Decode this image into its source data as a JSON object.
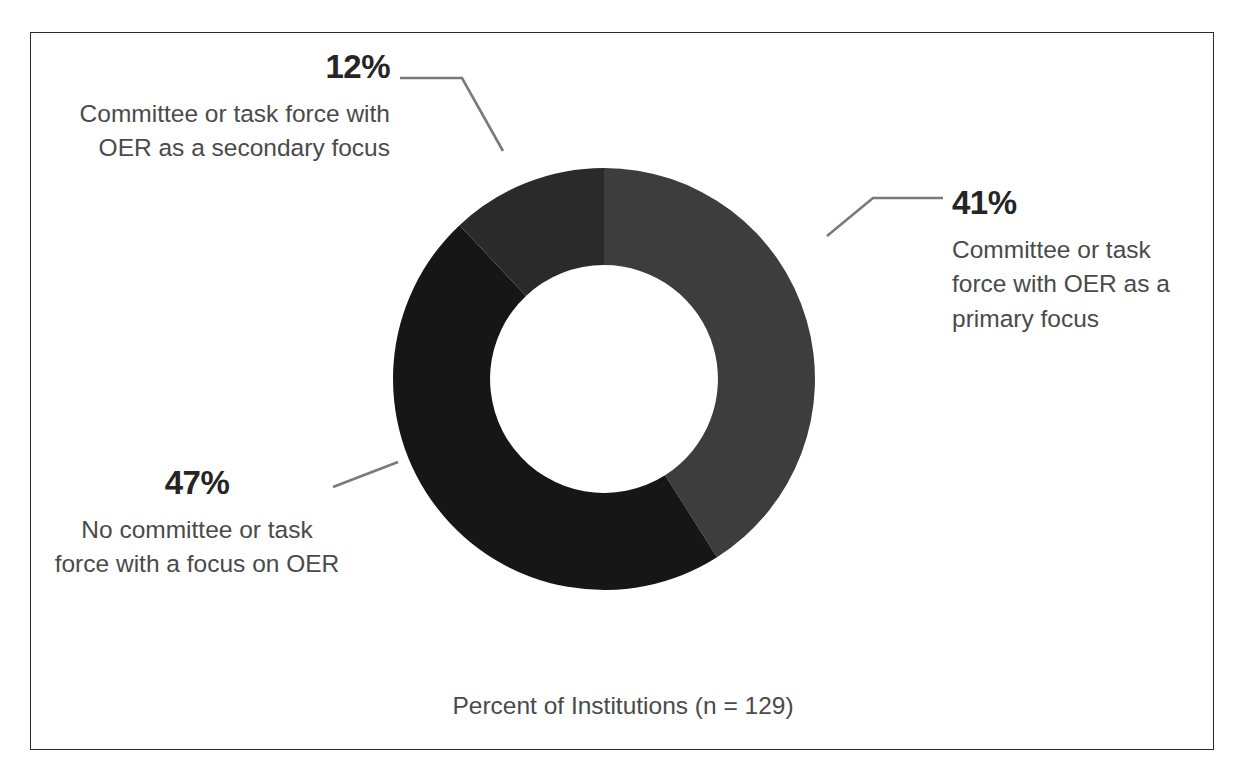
{
  "figure": {
    "caption": "Percent of Institutions (n = 129)",
    "frame_color": "#2b2b2b",
    "background": "#ffffff"
  },
  "chart_data": {
    "type": "pie",
    "variant": "donut",
    "title": "",
    "xlabel": "",
    "ylabel": "",
    "caption": "Percent of Institutions (n = 129)",
    "sample_size": 129,
    "units": "percent",
    "legend_position": "callout-labels",
    "grid": false,
    "start_angle_deg": 0,
    "direction": "clockwise",
    "inner_radius_ratio": 0.54,
    "categories": [
      "Committee or task force with OER as a primary focus",
      "No committee or task force with a focus on OER",
      "Committee or task force with OER as a secondary focus"
    ],
    "values": [
      41,
      47,
      12
    ],
    "labels": [
      "41%",
      "47%",
      "12%"
    ],
    "colors": [
      "#3d3d3d",
      "#161616",
      "#2a2a2a"
    ],
    "slices": [
      {
        "label": "41%",
        "value": 41,
        "name": "Committee or task force with OER as a primary focus",
        "color": "#3d3d3d",
        "start_deg": 0,
        "end_deg": 147.6
      },
      {
        "label": "47%",
        "value": 47,
        "name": "No committee or task force with a focus on OER",
        "color": "#161616",
        "start_deg": 147.6,
        "end_deg": 316.8
      },
      {
        "label": "12%",
        "value": 12,
        "name": "Committee or task force with OER as a secondary focus",
        "color": "#2a2a2a",
        "start_deg": 316.8,
        "end_deg": 360
      }
    ]
  },
  "callouts": {
    "secondary": {
      "percent": "12%",
      "description": "Committee or task force with OER as a secondary focus"
    },
    "primary": {
      "percent": "41%",
      "description": "Committee or task force with OER as a primary focus"
    },
    "none": {
      "percent": "47%",
      "description": "No committee or task force with a focus on OER"
    }
  }
}
